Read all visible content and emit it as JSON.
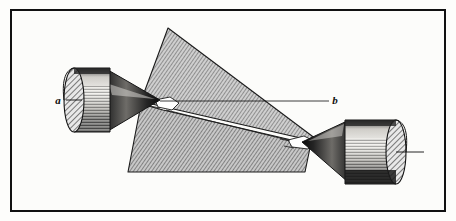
{
  "figure": {
    "kind": "engraving-plate",
    "caption": "",
    "background_color": "#fdfdfb",
    "frame": {
      "name": "plate-border",
      "color": "#111111",
      "thickness_px": 2.5
    },
    "labels": [
      {
        "id": "a",
        "text": "a",
        "x": 60,
        "y": 103,
        "style": "italic-serif"
      },
      {
        "id": "b",
        "text": "b",
        "x": 334,
        "y": 102,
        "style": "italic-serif"
      }
    ],
    "leader_lines": [
      {
        "name": "leader-a",
        "x1": 66,
        "y1": 100,
        "x2": 80,
        "y2": 100
      },
      {
        "name": "axis-line-b",
        "x1": 160,
        "y1": 101,
        "x2": 329,
        "y2": 101
      },
      {
        "name": "leader-right",
        "x1": 395,
        "y1": 152,
        "x2": 424,
        "y2": 152
      }
    ],
    "parts": [
      {
        "name": "left-cone-holder",
        "role": "conical pointer / holder",
        "label": "a",
        "orientation": "points-right"
      },
      {
        "name": "upper-prism",
        "role": "hatched wedge (upper crystal face)",
        "shading": "diagonal-hatch"
      },
      {
        "name": "lower-prism",
        "role": "hatched wedge (lower crystal face)",
        "shading": "diagonal-hatch"
      },
      {
        "name": "right-cone-holder",
        "role": "conical pointer / holder",
        "label": "",
        "orientation": "points-left"
      }
    ],
    "colors": {
      "ink": "#111111",
      "hatch_fill": "#b9b9b9",
      "hatch_line": "#4a4a4a",
      "paper": "#fdfdfb",
      "shadow_dark": "#1a1a1a"
    }
  }
}
